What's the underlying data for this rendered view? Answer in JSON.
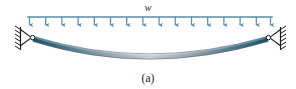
{
  "figure": {
    "caption": "(a)",
    "load_label": "w",
    "type": "simply-supported beam with uniformly distributed load",
    "colors": {
      "load_line": "#5b8ca6",
      "arrow": "#5b8ca6",
      "beam_end_dark": "#2e5f73",
      "beam_mid_light": "#c9ced2",
      "beam_outline": "#5a6a72",
      "support_stroke": "#1a1a1a",
      "pin_fill": "#ffffff",
      "text": "#231f20",
      "background": "#ffffff"
    },
    "geometry": {
      "canvas_width": 296,
      "canvas_height": 89,
      "load_line_y": 17,
      "load_line_x_start": 28,
      "load_line_x_end": 272,
      "arrow_count": 16,
      "arrow_tip_y": 29,
      "beam_left_x": 33,
      "beam_right_x": 268,
      "beam_support_y": 37,
      "beam_mid_sag_y": 62,
      "beam_thickness": 5
    },
    "load": {
      "symbol": "w",
      "distribution": "uniform",
      "direction": "downward"
    },
    "supports": [
      {
        "name": "left-pin-support",
        "position": "left",
        "kind": "pin"
      },
      {
        "name": "right-pin-support",
        "position": "right",
        "kind": "pin"
      }
    ],
    "caption_x": 148,
    "caption_y": 82,
    "load_label_x": 148,
    "load_label_y": 11
  }
}
